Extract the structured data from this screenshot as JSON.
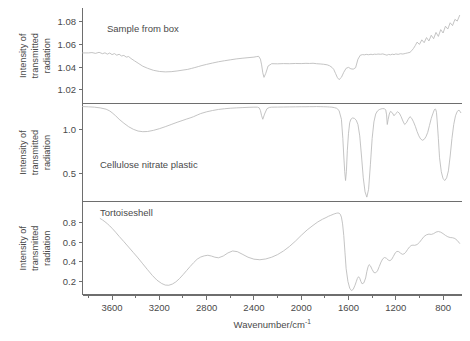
{
  "figure": {
    "background": "#ffffff",
    "trace_color": "#b9b9b9",
    "axis_color": "#6e6e6e",
    "text_color": "#4a4a4a",
    "xlabel_main": "Wavenumber/cm",
    "xlabel_superscript": "-1",
    "ylabel_lines": [
      "Intensity of",
      "transmitted",
      "radiation"
    ],
    "x_ticklabels": [
      "3600",
      "3200",
      "2800",
      "2400",
      "2000",
      "1600",
      "1200",
      "800"
    ],
    "x_tickvalues": [
      3600,
      3200,
      2800,
      2400,
      2000,
      1600,
      1200,
      800
    ],
    "x_range": [
      3850,
      640
    ]
  },
  "chart_data": {
    "type": "line",
    "title": "",
    "xlabel": "Wavenumber/cm^-1",
    "ylabel": "Intensity of transmitted radiation",
    "xlim": [
      3850,
      640
    ],
    "grid": false,
    "legend": "none",
    "panels": [
      {
        "name": "sample-from-box",
        "label": "Sample from box",
        "ylabel": "Intensity of transmitted radiation",
        "yticklabels": [
          "1.08",
          "1.06",
          "1.04",
          "1.02"
        ],
        "ytickvalues": [
          1.08,
          1.06,
          1.04,
          1.02
        ],
        "ylim": [
          1.008,
          1.092
        ],
        "x": [
          3850,
          3800,
          3770,
          3740,
          3710,
          3680,
          3660,
          3640,
          3620,
          3600,
          3580,
          3560,
          3540,
          3520,
          3500,
          3480,
          3460,
          3440,
          3410,
          3380,
          3340,
          3300,
          3250,
          3200,
          3150,
          3100,
          3050,
          3000,
          2960,
          2930,
          2900,
          2870,
          2840,
          2800,
          2750,
          2700,
          2650,
          2600,
          2550,
          2500,
          2450,
          2400,
          2380,
          2360,
          2345,
          2335,
          2325,
          2315,
          2300,
          2280,
          2250,
          2200,
          2150,
          2100,
          2050,
          2000,
          1960,
          1930,
          1900,
          1870,
          1840,
          1810,
          1780,
          1760,
          1740,
          1725,
          1710,
          1695,
          1680,
          1660,
          1640,
          1620,
          1600,
          1580,
          1560,
          1540,
          1520,
          1500,
          1480,
          1465,
          1450,
          1430,
          1410,
          1395,
          1380,
          1365,
          1350,
          1330,
          1310,
          1290,
          1275,
          1260,
          1245,
          1230,
          1215,
          1200,
          1180,
          1160,
          1140,
          1120,
          1100,
          1080,
          1065,
          1050,
          1035,
          1020,
          1000,
          980,
          960,
          940,
          920,
          900,
          880,
          860,
          840,
          820,
          800,
          780,
          760,
          740,
          720,
          700,
          680,
          660
        ],
        "y": [
          1.0525,
          1.0525,
          1.0528,
          1.0521,
          1.053,
          1.0518,
          1.0526,
          1.0514,
          1.0524,
          1.051,
          1.0519,
          1.0505,
          1.0513,
          1.0498,
          1.0503,
          1.0488,
          1.0493,
          1.0476,
          1.0455,
          1.0435,
          1.0408,
          1.039,
          1.0372,
          1.0362,
          1.0358,
          1.036,
          1.0366,
          1.0374,
          1.038,
          1.0388,
          1.0396,
          1.0405,
          1.0414,
          1.0424,
          1.0436,
          1.0447,
          1.0456,
          1.0464,
          1.0472,
          1.0478,
          1.0483,
          1.0488,
          1.0492,
          1.0495,
          1.047,
          1.042,
          1.035,
          1.031,
          1.0345,
          1.041,
          1.043,
          1.0429,
          1.0431,
          1.043,
          1.0432,
          1.0431,
          1.0433,
          1.0432,
          1.0434,
          1.043,
          1.0428,
          1.0425,
          1.042,
          1.0412,
          1.0398,
          1.038,
          1.0345,
          1.031,
          1.029,
          1.031,
          1.0355,
          1.039,
          1.0398,
          1.0385,
          1.0382,
          1.0395,
          1.047,
          1.0505,
          1.051,
          1.0508,
          1.0512,
          1.0509,
          1.0513,
          1.051,
          1.0514,
          1.0512,
          1.0515,
          1.0513,
          1.0516,
          1.051,
          1.0505,
          1.0512,
          1.0508,
          1.0514,
          1.051,
          1.0516,
          1.0512,
          1.0518,
          1.0515,
          1.052,
          1.0525,
          1.053,
          1.0545,
          1.0565,
          1.059,
          1.062,
          1.06,
          1.064,
          1.0615,
          1.066,
          1.063,
          1.068,
          1.065,
          1.0705,
          1.067,
          1.073,
          1.07,
          1.076,
          1.0735,
          1.079,
          1.0765,
          1.082,
          1.0805,
          1.0855,
          1.084
        ]
      },
      {
        "name": "cellulose-nitrate-plastic",
        "label": "Cellulose nitrate plastic",
        "ylabel": "Intensity of transmitted radiation",
        "yticklabels": [
          "1.0",
          "0.5"
        ],
        "ytickvalues": [
          1.0,
          0.5
        ],
        "ylim": [
          0.18,
          1.3
        ],
        "x": [
          3850,
          3800,
          3750,
          3700,
          3650,
          3620,
          3600,
          3570,
          3540,
          3500,
          3460,
          3420,
          3380,
          3340,
          3300,
          3250,
          3200,
          3150,
          3100,
          3050,
          3000,
          2970,
          2940,
          2910,
          2880,
          2850,
          2800,
          2750,
          2700,
          2650,
          2600,
          2550,
          2500,
          2450,
          2400,
          2370,
          2355,
          2345,
          2335,
          2325,
          2310,
          2290,
          2270,
          2250,
          2200,
          2150,
          2100,
          2050,
          2000,
          1960,
          1930,
          1900,
          1870,
          1840,
          1810,
          1780,
          1760,
          1740,
          1720,
          1700,
          1680,
          1660,
          1648,
          1640,
          1632,
          1625,
          1618,
          1610,
          1600,
          1590,
          1580,
          1565,
          1550,
          1535,
          1520,
          1505,
          1490,
          1475,
          1460,
          1445,
          1430,
          1415,
          1400,
          1385,
          1370,
          1355,
          1340,
          1325,
          1310,
          1295,
          1285,
          1278,
          1272,
          1265,
          1255,
          1245,
          1230,
          1215,
          1200,
          1185,
          1170,
          1155,
          1140,
          1125,
          1110,
          1095,
          1080,
          1065,
          1050,
          1035,
          1020,
          1005,
          990,
          975,
          960,
          945,
          930,
          915,
          900,
          885,
          875,
          868,
          862,
          856,
          850,
          840,
          830,
          815,
          800,
          785,
          770,
          755,
          740,
          725,
          710,
          695,
          680,
          665,
          650
        ],
        "y": [
          1.265,
          1.262,
          1.258,
          1.25,
          1.235,
          1.215,
          1.195,
          1.16,
          1.12,
          1.075,
          1.035,
          1.005,
          0.985,
          0.978,
          0.98,
          0.993,
          1.012,
          1.035,
          1.06,
          1.085,
          1.108,
          1.122,
          1.135,
          1.15,
          1.168,
          1.185,
          1.205,
          1.22,
          1.232,
          1.24,
          1.246,
          1.25,
          1.253,
          1.256,
          1.258,
          1.258,
          1.25,
          1.22,
          1.16,
          1.12,
          1.18,
          1.24,
          1.255,
          1.258,
          1.259,
          1.26,
          1.261,
          1.262,
          1.263,
          1.263,
          1.264,
          1.264,
          1.265,
          1.264,
          1.263,
          1.262,
          1.26,
          1.258,
          1.253,
          1.245,
          1.22,
          1.12,
          0.9,
          0.7,
          0.52,
          0.42,
          0.52,
          0.76,
          0.96,
          1.08,
          1.12,
          1.135,
          1.13,
          1.11,
          1.06,
          0.93,
          0.7,
          0.45,
          0.29,
          0.23,
          0.32,
          0.6,
          0.9,
          1.09,
          1.18,
          1.215,
          1.23,
          1.238,
          1.242,
          1.24,
          1.225,
          1.17,
          1.06,
          1.115,
          1.18,
          1.21,
          1.195,
          1.16,
          1.185,
          1.205,
          1.19,
          1.15,
          1.1,
          1.06,
          1.08,
          1.12,
          1.15,
          1.13,
          1.09,
          1.04,
          0.98,
          0.93,
          0.895,
          0.88,
          0.89,
          0.92,
          0.97,
          1.05,
          1.13,
          1.19,
          1.225,
          1.238,
          1.232,
          1.2,
          1.1,
          0.9,
          0.68,
          0.52,
          0.44,
          0.42,
          0.45,
          0.53,
          0.7,
          0.9,
          1.06,
          1.16,
          1.21,
          1.225,
          1.195,
          1.12,
          1.06,
          1.11,
          1.175,
          1.215
        ]
      },
      {
        "name": "tortoiseshell",
        "label": "Tortoiseshell",
        "ylabel": "Intensity of transmitted radiation",
        "yticklabels": [
          "0.8",
          "0.6",
          "0.4",
          "0.2"
        ],
        "ytickvalues": [
          0.8,
          0.6,
          0.4,
          0.2
        ],
        "ylim": [
          0.06,
          1.02
        ],
        "x": [
          3700,
          3680,
          3660,
          3640,
          3620,
          3600,
          3570,
          3540,
          3500,
          3460,
          3420,
          3380,
          3340,
          3300,
          3260,
          3220,
          3180,
          3150,
          3120,
          3090,
          3060,
          3030,
          3000,
          2970,
          2940,
          2910,
          2880,
          2850,
          2820,
          2790,
          2760,
          2730,
          2700,
          2660,
          2620,
          2580,
          2540,
          2500,
          2450,
          2400,
          2350,
          2300,
          2250,
          2200,
          2150,
          2100,
          2050,
          2000,
          1950,
          1900,
          1860,
          1820,
          1790,
          1770,
          1750,
          1730,
          1715,
          1700,
          1690,
          1680,
          1670,
          1660,
          1650,
          1640,
          1630,
          1620,
          1605,
          1590,
          1575,
          1560,
          1545,
          1535,
          1525,
          1515,
          1505,
          1495,
          1485,
          1470,
          1455,
          1445,
          1435,
          1425,
          1415,
          1400,
          1385,
          1370,
          1355,
          1340,
          1325,
          1310,
          1295,
          1280,
          1265,
          1250,
          1235,
          1220,
          1205,
          1190,
          1175,
          1160,
          1145,
          1130,
          1115,
          1100,
          1085,
          1070,
          1055,
          1040,
          1020,
          1000,
          980,
          960,
          940,
          920,
          900,
          880,
          860,
          840,
          820,
          800,
          780,
          760,
          740,
          720,
          700,
          680,
          660
        ],
        "y": [
          0.845,
          0.83,
          0.812,
          0.792,
          0.77,
          0.745,
          0.705,
          0.662,
          0.608,
          0.552,
          0.496,
          0.44,
          0.38,
          0.32,
          0.262,
          0.212,
          0.178,
          0.162,
          0.16,
          0.172,
          0.195,
          0.228,
          0.268,
          0.31,
          0.352,
          0.392,
          0.428,
          0.45,
          0.462,
          0.468,
          0.46,
          0.448,
          0.442,
          0.46,
          0.492,
          0.512,
          0.505,
          0.48,
          0.448,
          0.428,
          0.422,
          0.43,
          0.448,
          0.475,
          0.512,
          0.558,
          0.612,
          0.672,
          0.728,
          0.775,
          0.81,
          0.838,
          0.855,
          0.868,
          0.878,
          0.888,
          0.895,
          0.9,
          0.902,
          0.9,
          0.89,
          0.86,
          0.79,
          0.67,
          0.5,
          0.33,
          0.2,
          0.13,
          0.105,
          0.118,
          0.16,
          0.195,
          0.23,
          0.248,
          0.232,
          0.198,
          0.175,
          0.185,
          0.235,
          0.3,
          0.348,
          0.372,
          0.36,
          0.322,
          0.29,
          0.288,
          0.308,
          0.352,
          0.398,
          0.432,
          0.445,
          0.438,
          0.42,
          0.412,
          0.425,
          0.458,
          0.492,
          0.508,
          0.505,
          0.49,
          0.478,
          0.482,
          0.5,
          0.528,
          0.552,
          0.568,
          0.572,
          0.57,
          0.578,
          0.6,
          0.632,
          0.662,
          0.678,
          0.685,
          0.682,
          0.69,
          0.706,
          0.712,
          0.705,
          0.69,
          0.672,
          0.658,
          0.65,
          0.648,
          0.64,
          0.62,
          0.59,
          0.562,
          0.548,
          0.552
        ]
      }
    ]
  }
}
